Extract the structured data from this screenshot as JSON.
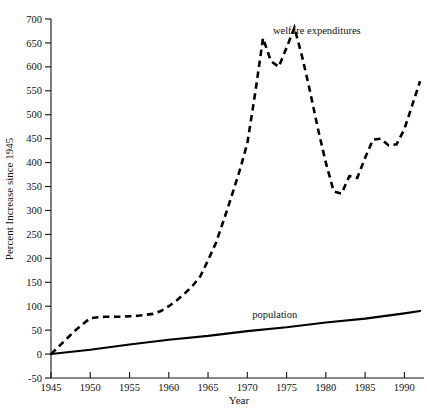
{
  "chart_data": {
    "type": "line",
    "title": "",
    "xlabel": "Year",
    "ylabel": "Percent Increase since 1945",
    "xlim": [
      1945,
      1992.5
    ],
    "ylim": [
      -50,
      700
    ],
    "yticks": [
      -50,
      0,
      50,
      100,
      150,
      200,
      250,
      300,
      350,
      400,
      450,
      500,
      550,
      600,
      650,
      700
    ],
    "xticks": [
      1945,
      1950,
      1955,
      1960,
      1965,
      1970,
      1975,
      1980,
      1985,
      1990
    ],
    "grid": false,
    "legend_position": "inline-annotations",
    "series": [
      {
        "name": "welfare expenditures",
        "style": "dashed",
        "color": "#000000",
        "label_x": 1972.5,
        "label_y": 668,
        "x": [
          1945,
          1946,
          1947,
          1948,
          1949,
          1950,
          1951,
          1952,
          1953,
          1954,
          1955,
          1956,
          1957,
          1958,
          1959,
          1960,
          1961,
          1962,
          1963,
          1964,
          1965,
          1966,
          1967,
          1968,
          1969,
          1970,
          1971,
          1972,
          1973,
          1974,
          1975,
          1976,
          1977,
          1978,
          1979,
          1980,
          1981,
          1982,
          1983,
          1984,
          1985,
          1986,
          1987,
          1988,
          1989,
          1990,
          1991,
          1992
        ],
        "y": [
          0,
          16,
          32,
          48,
          62,
          75,
          77,
          78,
          78,
          78,
          79,
          80,
          82,
          84,
          90,
          100,
          112,
          126,
          142,
          162,
          196,
          232,
          280,
          330,
          382,
          440,
          545,
          660,
          612,
          600,
          640,
          682,
          620,
          548,
          470,
          400,
          340,
          335,
          372,
          368,
          410,
          448,
          450,
          436,
          438,
          470,
          520,
          570
        ]
      },
      {
        "name": "population",
        "style": "solid",
        "color": "#000000",
        "label_x": 1973.5,
        "label_y": 76,
        "x": [
          1945,
          1950,
          1955,
          1960,
          1965,
          1970,
          1975,
          1980,
          1985,
          1990,
          1992
        ],
        "y": [
          0,
          9,
          20,
          30,
          38,
          48,
          56,
          66,
          74,
          85,
          90
        ]
      }
    ]
  },
  "axis": {
    "y_title": "Percent Increase since 1945",
    "x_title": "Year",
    "y_tick_labels": [
      "700",
      "650",
      "600",
      "550",
      "500",
      "450",
      "400",
      "350",
      "300",
      "250",
      "200",
      "150",
      "100",
      "50",
      "0",
      "-50"
    ],
    "x_tick_labels": [
      "1945",
      "1950",
      "1955",
      "1960",
      "1965",
      "1970",
      "1975",
      "1980",
      "1985",
      "1990"
    ]
  },
  "annotations": {
    "welfare_label": "welfare expenditures",
    "population_label": "population"
  }
}
